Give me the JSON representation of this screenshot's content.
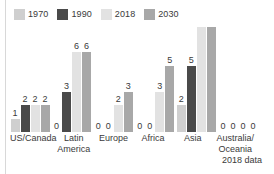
{
  "chart_data": {
    "type": "bar",
    "title": "",
    "xlabel": "",
    "ylabel": "",
    "ylim": [
      0,
      7
    ],
    "grid": false,
    "legend_position": "top-left",
    "clipped_note": "Asia 2018 and 2030 bars are cut off by the top edge of the figure",
    "categories": [
      "US/Canada",
      "Latin\nAmerica",
      "Europe",
      "Africa",
      "Asia",
      "Australia/\nOceania"
    ],
    "series": [
      {
        "name": "1970",
        "color": "#cfcfcf",
        "values": [
          1,
          0,
          0,
          0,
          2,
          0
        ]
      },
      {
        "name": "1990",
        "color": "#4a4a4a",
        "values": [
          2,
          3,
          0,
          0,
          5,
          0
        ]
      },
      {
        "name": "2018",
        "color": "#e2e2e2",
        "values": [
          2,
          6,
          2,
          3,
          9,
          0
        ]
      },
      {
        "name": "2030",
        "color": "#a8a8a8",
        "values": [
          2,
          6,
          3,
          5,
          9,
          0
        ]
      }
    ],
    "value_labels": {
      "US/Canada": [
        "1",
        "2",
        "2",
        "2"
      ],
      "Latin America": [
        "0",
        "3",
        "6",
        "6"
      ],
      "Europe": [
        "0",
        "0",
        "2",
        "3"
      ],
      "Africa": [
        "0",
        "0",
        "3",
        "5"
      ],
      "Asia": [
        "2",
        "5",
        "",
        ""
      ],
      "Australia/Oceania": [
        "0",
        "0",
        "0",
        "0"
      ]
    },
    "footnote": "2018 data"
  },
  "legend": {
    "items": [
      {
        "label": "1970",
        "color": "#cfcfcf"
      },
      {
        "label": "1990",
        "color": "#4a4a4a"
      },
      {
        "label": "2018",
        "color": "#e2e2e2"
      },
      {
        "label": "2030",
        "color": "#a8a8a8"
      }
    ]
  },
  "footnote": {
    "text": "2018 data"
  }
}
